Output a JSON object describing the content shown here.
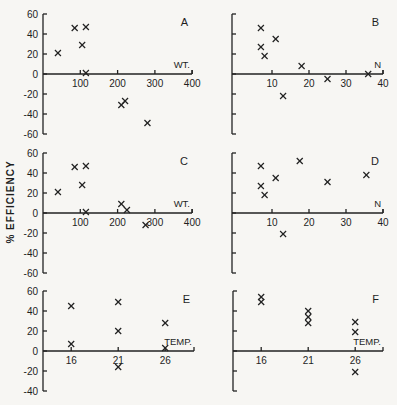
{
  "figure": {
    "ylabel": "% EFFICIENCY"
  },
  "chart_data": [
    {
      "panel": "A",
      "type": "scatter",
      "xlabel": "WT.",
      "ylabel": "% EFFICIENCY",
      "xlim": [
        0,
        400
      ],
      "ylim": [
        -60,
        60
      ],
      "xticks": [
        100,
        200,
        300,
        400
      ],
      "yticks": [
        60,
        40,
        20,
        0,
        -20,
        -40,
        -60
      ],
      "x": [
        40,
        85,
        115,
        105,
        115,
        210,
        220,
        280
      ],
      "y": [
        21,
        46,
        47,
        29,
        1,
        -31,
        -27,
        -49
      ],
      "marker": "x",
      "grid": false
    },
    {
      "panel": "B",
      "type": "scatter",
      "xlabel": "N",
      "ylabel": "% EFFICIENCY",
      "xlim": [
        0,
        40
      ],
      "ylim": [
        -60,
        60
      ],
      "xticks": [
        10,
        20,
        30,
        40
      ],
      "yticks": [
        60,
        40,
        20,
        0,
        -20,
        -40,
        -60
      ],
      "x": [
        7,
        11,
        7,
        8,
        18,
        25,
        36,
        13
      ],
      "y": [
        46,
        35,
        27,
        18,
        8,
        -5,
        0,
        -22
      ],
      "marker": "x",
      "grid": false
    },
    {
      "panel": "C",
      "type": "scatter",
      "xlabel": "WT.",
      "ylabel": "% EFFICIENCY",
      "xlim": [
        0,
        400
      ],
      "ylim": [
        -60,
        60
      ],
      "xticks": [
        100,
        200,
        300,
        400
      ],
      "yticks": [
        60,
        40,
        20,
        0,
        -20,
        -40,
        -60
      ],
      "x": [
        40,
        85,
        115,
        105,
        115,
        210,
        225,
        275
      ],
      "y": [
        21,
        46,
        47,
        28,
        1,
        9,
        3,
        -12
      ],
      "marker": "x",
      "grid": false
    },
    {
      "panel": "D",
      "type": "scatter",
      "xlabel": "N",
      "ylabel": "% EFFICIENCY",
      "xlim": [
        0,
        40
      ],
      "ylim": [
        -60,
        60
      ],
      "xticks": [
        10,
        20,
        30,
        40
      ],
      "yticks": [
        60,
        40,
        20,
        0,
        -20,
        -40,
        -60
      ],
      "x": [
        7,
        17.5,
        11,
        7,
        8,
        25,
        35.5,
        13
      ],
      "y": [
        47,
        52,
        35,
        27,
        18,
        31,
        38,
        -21
      ],
      "marker": "x",
      "grid": false
    },
    {
      "panel": "E",
      "type": "scatter",
      "xlabel": "TEMP.",
      "ylabel": "% EFFICIENCY",
      "xlim": [
        13,
        29
      ],
      "ylim": [
        -40,
        60
      ],
      "xticks": [
        16,
        21,
        26
      ],
      "yticks": [
        60,
        40,
        20,
        0,
        -20,
        -40
      ],
      "x": [
        16,
        16,
        21,
        21,
        21,
        26,
        26
      ],
      "y": [
        45,
        7,
        49,
        20,
        -16,
        28,
        3
      ],
      "marker": "x",
      "grid": false
    },
    {
      "panel": "F",
      "type": "scatter",
      "xlabel": "TEMP.",
      "ylabel": "% EFFICIENCY",
      "xlim": [
        13,
        29
      ],
      "ylim": [
        -40,
        60
      ],
      "xticks": [
        16,
        21,
        26
      ],
      "yticks": [
        60,
        40,
        20,
        0,
        -20,
        -40
      ],
      "x": [
        16,
        16,
        21,
        21,
        21,
        26,
        26,
        26
      ],
      "y": [
        54,
        49,
        40,
        34,
        28,
        29,
        19,
        -21
      ],
      "marker": "x",
      "grid": false
    }
  ],
  "layout": {
    "panels": {
      "A": {
        "axis_x": 43,
        "x0": 43,
        "xscale": 0.373,
        "xmin": 0,
        "y0": 74,
        "ymin": -60,
        "ymax": 60,
        "xend": 192,
        "show_yticklabels": true
      },
      "B": {
        "axis_x": 232,
        "x0": 235,
        "xscale": 3.7,
        "xmin": 0,
        "y0": 74,
        "ymin": -60,
        "ymax": 60,
        "xend": 383,
        "show_yticklabels": false
      },
      "C": {
        "axis_x": 43,
        "x0": 43,
        "xscale": 0.373,
        "xmin": 0,
        "y0": 213,
        "ymin": -60,
        "ymax": 60,
        "xend": 192,
        "show_yticklabels": true
      },
      "D": {
        "axis_x": 232,
        "x0": 235,
        "xscale": 3.7,
        "xmin": 0,
        "y0": 213,
        "ymin": -60,
        "ymax": 60,
        "xend": 383,
        "show_yticklabels": false
      },
      "E": {
        "axis_x": 43,
        "x0": 43,
        "xscale": 9.4,
        "xmin": 13,
        "y0": 351,
        "ymin": -40,
        "ymax": 60,
        "xend": 194,
        "show_yticklabels": true
      },
      "F": {
        "axis_x": 233,
        "x0": 233,
        "xscale": 9.4,
        "xmin": 13,
        "y0": 351,
        "ymin": -40,
        "ymax": 60,
        "xend": 383,
        "show_yticklabels": false
      }
    },
    "yscale": 1.0
  }
}
